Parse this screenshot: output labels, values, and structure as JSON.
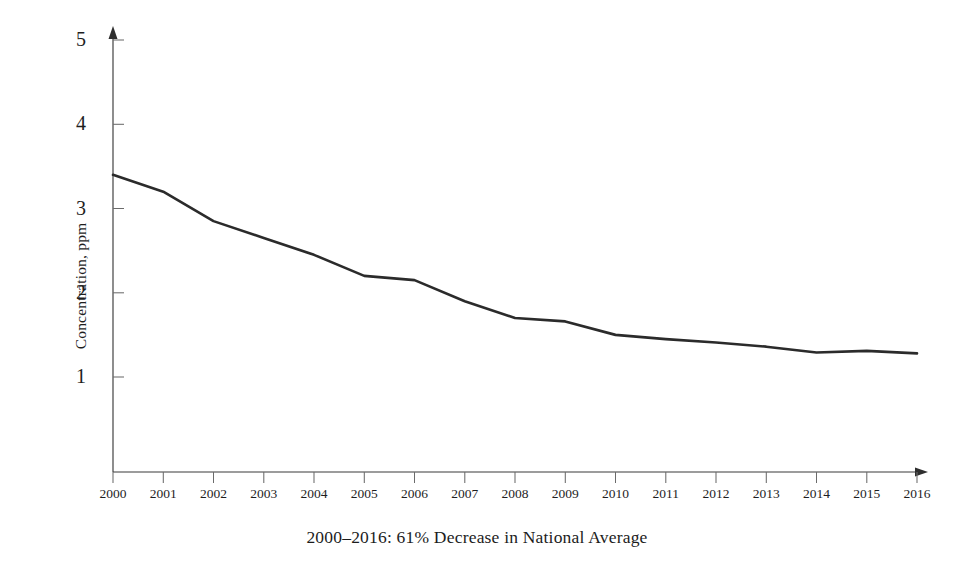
{
  "chart_data": {
    "type": "line",
    "title": "",
    "subtitle": "",
    "caption": "2000–2016:  61% Decrease in National Average",
    "xlabel": "",
    "ylabel": "Concentration, ppm",
    "categories": [
      "2000",
      "2001",
      "2002",
      "2003",
      "2004",
      "2005",
      "2006",
      "2007",
      "2008",
      "2009",
      "2010",
      "2011",
      "2012",
      "2013",
      "2014",
      "2015",
      "2016"
    ],
    "x": [
      2000,
      2001,
      2002,
      2003,
      2004,
      2005,
      2006,
      2007,
      2008,
      2009,
      2010,
      2011,
      2012,
      2013,
      2014,
      2015,
      2016
    ],
    "values": [
      3.4,
      3.2,
      2.85,
      2.65,
      2.45,
      2.2,
      2.15,
      1.9,
      1.7,
      1.66,
      1.5,
      1.45,
      1.41,
      1.36,
      1.29,
      1.31,
      1.28
    ],
    "series": [
      {
        "name": "National Average",
        "values": [
          3.4,
          3.2,
          2.85,
          2.65,
          2.45,
          2.2,
          2.15,
          1.9,
          1.7,
          1.66,
          1.5,
          1.45,
          1.41,
          1.36,
          1.29,
          1.31,
          1.28
        ],
        "color": "#2b2b2b"
      }
    ],
    "ylim": [
      0,
      5
    ],
    "xlim": [
      2000,
      2016
    ],
    "yticks": [
      1,
      2,
      3,
      4,
      5
    ],
    "ytick_labels": [
      "1",
      "2",
      "3",
      "4",
      "5"
    ],
    "xtick_labels": [
      "2000",
      "2001",
      "2002",
      "2003",
      "2004",
      "2005",
      "2006",
      "2007",
      "2008",
      "2009",
      "2010",
      "2011",
      "2012",
      "2013",
      "2014",
      "2015",
      "2016"
    ],
    "grid": false,
    "legend": false,
    "legend_position": "none",
    "axis_arrows": true,
    "line_color": "#2b2b2b",
    "axis_color": "#3a3a3a",
    "background_color": "#ffffff",
    "annotations": []
  }
}
